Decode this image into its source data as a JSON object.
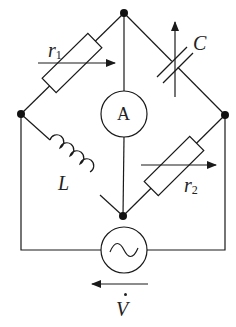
{
  "diagram": {
    "type": "AC bridge circuit",
    "nodes": [
      {
        "id": "top",
        "x": 124,
        "y": 13
      },
      {
        "id": "left",
        "x": 21,
        "y": 114
      },
      {
        "id": "right",
        "x": 225,
        "y": 115
      },
      {
        "id": "bottom",
        "x": 123,
        "y": 216
      }
    ],
    "components": {
      "r1": {
        "label": "r",
        "subscript": "1",
        "kind": "variable-resistor",
        "between": [
          "left",
          "top"
        ]
      },
      "C": {
        "label": "C",
        "kind": "variable-capacitor",
        "between": [
          "top",
          "right"
        ]
      },
      "L": {
        "label": "L",
        "kind": "inductor",
        "between": [
          "left",
          "bottom"
        ]
      },
      "r2": {
        "label": "r",
        "subscript": "2",
        "kind": "variable-resistor",
        "between": [
          "right",
          "bottom"
        ]
      },
      "ammeter": {
        "label": "A",
        "kind": "ammeter",
        "between": [
          "top",
          "bottom"
        ]
      },
      "source": {
        "label": "V",
        "kind": "ac-voltage-source",
        "phasor_dot": true,
        "arrow_direction": "left",
        "between": [
          "left",
          "right"
        ]
      }
    },
    "colors": {
      "line": "#1a1a1a",
      "background": "#ffffff"
    }
  }
}
